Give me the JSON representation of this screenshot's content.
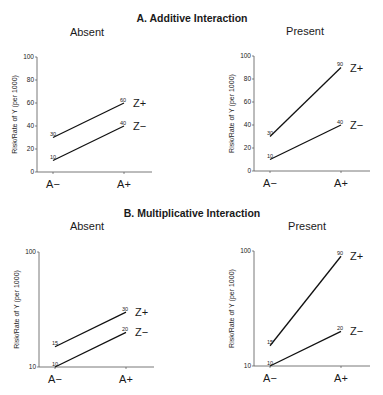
{
  "sections": [
    {
      "title": "A. Additive Interaction"
    },
    {
      "title": "B. Multiplicative Interaction"
    }
  ],
  "chart_data": [
    {
      "type": "line",
      "section": "A. Additive Interaction",
      "title": "Absent",
      "categories": [
        "A−",
        "A+"
      ],
      "series": [
        {
          "name": "Z+",
          "values": [
            30,
            60
          ]
        },
        {
          "name": "Z−",
          "values": [
            10,
            40
          ]
        }
      ],
      "xlabel": "",
      "ylabel": "Risk/Rate of Y (per 1000)",
      "yscale": "linear",
      "ylim": [
        0,
        100
      ],
      "yticks": [
        0,
        20,
        40,
        60,
        80,
        100
      ],
      "grid": false,
      "legend_position": "inline-right"
    },
    {
      "type": "line",
      "section": "A. Additive Interaction",
      "title": "Present",
      "categories": [
        "A−",
        "A+"
      ],
      "series": [
        {
          "name": "Z+",
          "values": [
            30,
            90
          ]
        },
        {
          "name": "Z−",
          "values": [
            10,
            40
          ]
        }
      ],
      "xlabel": "",
      "ylabel": "Risk/Rate of Y (per 1000)",
      "yscale": "linear",
      "ylim": [
        0,
        100
      ],
      "yticks": [
        0,
        20,
        40,
        60,
        80,
        100
      ],
      "grid": false,
      "legend_position": "inline-right"
    },
    {
      "type": "line",
      "section": "B. Multiplicative Interaction",
      "title": "Absent",
      "categories": [
        "A−",
        "A+"
      ],
      "series": [
        {
          "name": "Z+",
          "values": [
            15,
            30
          ]
        },
        {
          "name": "Z−",
          "values": [
            10,
            20
          ]
        }
      ],
      "xlabel": "",
      "ylabel": "Risk/Rate of Y (per 1000)",
      "yscale": "log",
      "ylim": [
        10,
        100
      ],
      "yticks": [
        10,
        100
      ],
      "grid": false,
      "legend_position": "inline-right"
    },
    {
      "type": "line",
      "section": "B. Multiplicative Interaction",
      "title": "Present",
      "categories": [
        "A−",
        "A+"
      ],
      "series": [
        {
          "name": "Z+",
          "values": [
            15,
            90
          ]
        },
        {
          "name": "Z−",
          "values": [
            10,
            20
          ]
        }
      ],
      "xlabel": "",
      "ylabel": "Risk/Rate of Y (per 1000)",
      "yscale": "log",
      "ylim": [
        10,
        100
      ],
      "yticks": [
        10,
        100
      ],
      "grid": false,
      "legend_position": "inline-right"
    }
  ]
}
